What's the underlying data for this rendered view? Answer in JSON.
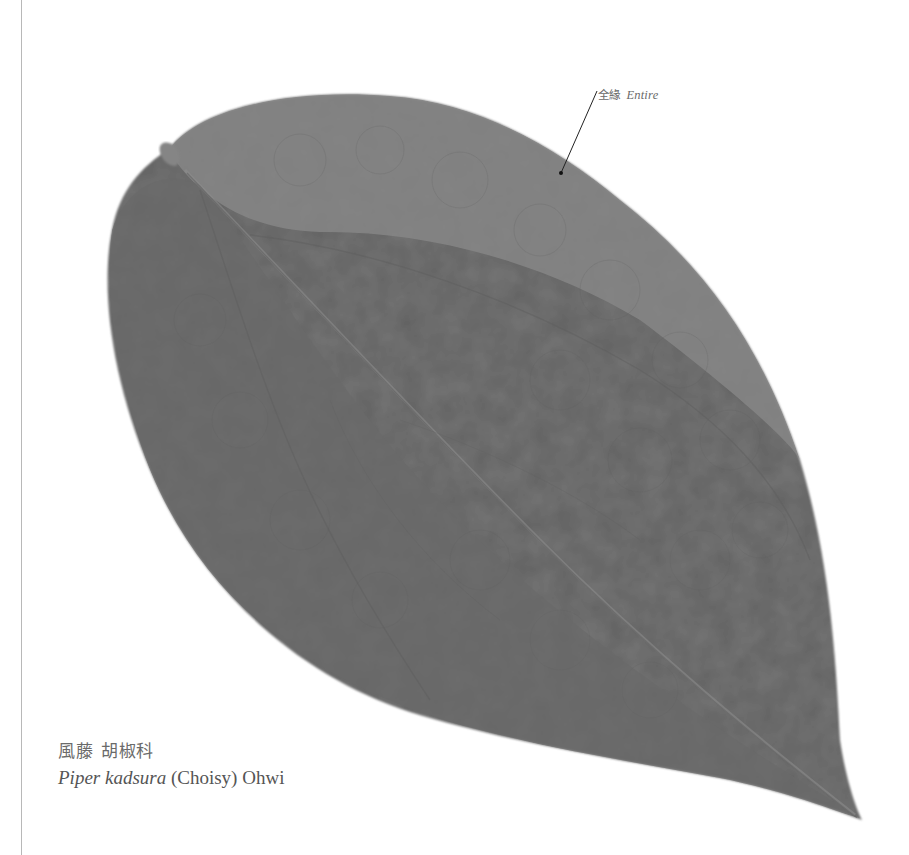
{
  "figure": {
    "leaf_color": "#777777",
    "leaf_color_dark": "#666666",
    "leaf_color_light": "#8a8a8a",
    "background": "#ffffff",
    "rule_color": "#b8b8b8"
  },
  "annotation": {
    "label_cjk": "全緣",
    "label_en": "Entire",
    "pointer_color": "#222222"
  },
  "caption": {
    "common_name_cjk": "風藤",
    "family_cjk": "胡椒科",
    "scientific_name": "Piper kadsura",
    "authority": "(Choisy) Ohwi"
  }
}
